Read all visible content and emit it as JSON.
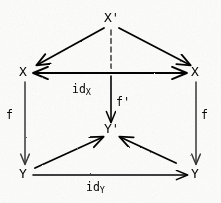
{
  "diagram": {
    "ink_color": "#14110f",
    "paper_color": "#fdfdfc",
    "nodes": [
      {
        "id": "x-prime-top",
        "label": "X",
        "prime": "'",
        "x": 110,
        "y": 18
      },
      {
        "id": "x-left",
        "label": "X",
        "prime": "",
        "x": 24,
        "y": 72
      },
      {
        "id": "x-right",
        "label": "X",
        "prime": "",
        "x": 196,
        "y": 72
      },
      {
        "id": "y-prime-mid",
        "label": "Y",
        "prime": "'",
        "x": 110,
        "y": 129
      },
      {
        "id": "y-left",
        "label": "Y",
        "prime": "",
        "x": 24,
        "y": 174
      },
      {
        "id": "y-right",
        "label": "Y",
        "prime": "",
        "x": 196,
        "y": 174
      }
    ],
    "edge_labels": [
      {
        "id": "id-x",
        "base": "id",
        "sub": "X",
        "x": 78,
        "y": 88
      },
      {
        "id": "f-prime",
        "base": "f",
        "sub": "",
        "prime": "'",
        "x": 118,
        "y": 101
      },
      {
        "id": "f-left",
        "base": "f",
        "sub": "",
        "x": 8,
        "y": 115
      },
      {
        "id": "f-right",
        "base": "f",
        "sub": "",
        "x": 203,
        "y": 115
      },
      {
        "id": "id-y",
        "base": "id",
        "sub": "Y",
        "x": 90,
        "y": 185
      }
    ],
    "edges": [
      {
        "id": "edge-xprime-to-xleft",
        "from": "x-prime-top",
        "to": "x-left",
        "style": "solid",
        "arrowheads": "end"
      },
      {
        "id": "edge-xprime-to-xright",
        "from": "x-prime-top",
        "to": "x-right",
        "style": "solid",
        "arrowheads": "end"
      },
      {
        "id": "edge-xprime-to-yprime",
        "from": "x-prime-top",
        "to": "y-prime-mid",
        "style": "dashed",
        "arrowheads": "end",
        "label": "f-prime"
      },
      {
        "id": "edge-xleft-to-xright",
        "from": "x-left",
        "to": "x-right",
        "style": "solid",
        "arrowheads": "both",
        "label": "id-x"
      },
      {
        "id": "edge-xleft-to-yleft",
        "from": "x-left",
        "to": "y-left",
        "style": "solid",
        "arrowheads": "end",
        "label": "f-left"
      },
      {
        "id": "edge-xright-to-yright",
        "from": "x-right",
        "to": "y-right",
        "style": "solid",
        "arrowheads": "end",
        "label": "f-right"
      },
      {
        "id": "edge-yleft-to-yprime",
        "from": "y-left",
        "to": "y-prime-mid",
        "style": "solid",
        "arrowheads": "end"
      },
      {
        "id": "edge-yright-to-yprime",
        "from": "y-right",
        "to": "y-prime-mid",
        "style": "solid",
        "arrowheads": "end"
      },
      {
        "id": "edge-yleft-to-yright",
        "from": "y-left",
        "to": "y-right",
        "style": "solid",
        "arrowheads": "end",
        "label": "id-y"
      }
    ]
  }
}
